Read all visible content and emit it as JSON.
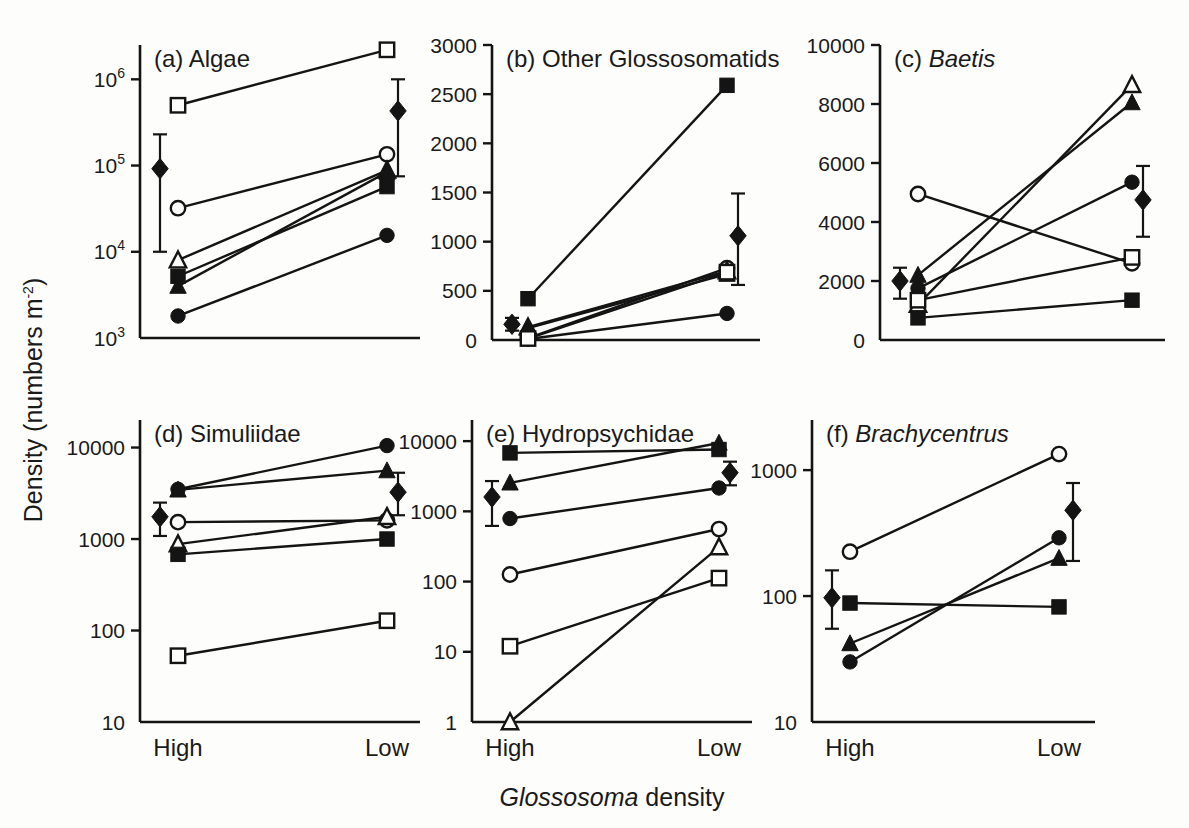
{
  "figure": {
    "y_axis_label_main": "Density (numbers m",
    "y_axis_label_sup": "-2",
    "y_axis_label_close": ")",
    "x_axis_label_italic": "Glossosoma",
    "x_axis_label_rest": " density",
    "categories": [
      "High",
      "Low"
    ],
    "line_color": "#141414",
    "background": "#fdfdfb"
  },
  "chart_data": [
    {
      "type": "line",
      "panel": "a",
      "title": "(a) Algae",
      "title_italic": "",
      "xlabel": "Glossosoma density",
      "ylabel": "Density (numbers m-2)",
      "yscale": "log",
      "ylim": [
        1000,
        2500000
      ],
      "ytick_values": [
        1000,
        10000,
        100000,
        1000000
      ],
      "ytick_labels": [
        "10^3",
        "10^4",
        "10^5",
        "10^6"
      ],
      "categories": [
        "High",
        "Low"
      ],
      "grid": false,
      "legend": "none",
      "series": [
        {
          "name": "open-square",
          "marker": "open-square",
          "values": [
            500000,
            2200000
          ]
        },
        {
          "name": "open-circle",
          "marker": "open-circle",
          "values": [
            32000,
            135000
          ]
        },
        {
          "name": "open-triangle",
          "marker": "open-triangle",
          "values": [
            8000,
            88000
          ]
        },
        {
          "name": "filled-square",
          "marker": "filled-square",
          "values": [
            5200,
            57000
          ]
        },
        {
          "name": "filled-triangle",
          "marker": "filled-triangle",
          "values": [
            4000,
            84000
          ]
        },
        {
          "name": "filled-circle",
          "marker": "filled-circle",
          "values": [
            1800,
            15500
          ]
        },
        {
          "name": "mean-diamond",
          "marker": "filled-diamond",
          "values": [
            92000,
            430000
          ],
          "error_high": [
            230000,
            1000000
          ],
          "error_low": [
            10000,
            75000
          ]
        }
      ]
    },
    {
      "type": "line",
      "panel": "b",
      "title": "(b) Other Glossosomatids",
      "title_italic": "",
      "xlabel": "Glossosoma density",
      "ylabel": "Density (numbers m-2)",
      "yscale": "linear",
      "ylim": [
        0,
        3000
      ],
      "ytick_values": [
        0,
        500,
        1000,
        1500,
        2000,
        2500,
        3000
      ],
      "ytick_labels": [
        "0",
        "500",
        "1000",
        "1500",
        "2000",
        "2500",
        "3000"
      ],
      "categories": [
        "High",
        "Low"
      ],
      "grid": false,
      "legend": "none",
      "series": [
        {
          "name": "filled-square",
          "marker": "filled-square",
          "values": [
            420,
            2590
          ]
        },
        {
          "name": "open-circle",
          "marker": "open-circle",
          "values": [
            20,
            730
          ]
        },
        {
          "name": "open-triangle",
          "marker": "open-triangle",
          "values": [
            130,
            700
          ]
        },
        {
          "name": "filled-triangle",
          "marker": "filled-triangle",
          "values": [
            120,
            670
          ]
        },
        {
          "name": "filled-circle",
          "marker": "filled-circle",
          "values": [
            10,
            270
          ]
        },
        {
          "name": "open-square",
          "marker": "open-square",
          "values": [
            15,
            690
          ]
        },
        {
          "name": "mean-diamond",
          "marker": "filled-diamond",
          "values": [
            160,
            1060
          ],
          "error_high": [
            225,
            1490
          ],
          "error_low": [
            95,
            560
          ]
        }
      ]
    },
    {
      "type": "line",
      "panel": "c",
      "title": "(c) Baetis",
      "title_italic": "Baetis",
      "xlabel": "Glossosoma density",
      "ylabel": "Density (numbers m-2)",
      "yscale": "linear",
      "ylim": [
        0,
        10000
      ],
      "ytick_values": [
        0,
        2000,
        4000,
        6000,
        8000,
        10000
      ],
      "ytick_labels": [
        "0",
        "2000",
        "4000",
        "6000",
        "8000",
        "10000"
      ],
      "categories": [
        "High",
        "Low"
      ],
      "grid": false,
      "legend": "none",
      "series": [
        {
          "name": "open-circle",
          "marker": "open-circle",
          "values": [
            4950,
            2600
          ]
        },
        {
          "name": "filled-triangle",
          "marker": "filled-triangle",
          "values": [
            2200,
            8050
          ]
        },
        {
          "name": "open-triangle",
          "marker": "open-triangle",
          "values": [
            1200,
            8650
          ]
        },
        {
          "name": "filled-circle",
          "marker": "filled-circle",
          "values": [
            1750,
            5350
          ]
        },
        {
          "name": "open-square",
          "marker": "open-square",
          "values": [
            1350,
            2800
          ]
        },
        {
          "name": "filled-square",
          "marker": "filled-square",
          "values": [
            750,
            1350
          ]
        },
        {
          "name": "mean-diamond",
          "marker": "filled-diamond",
          "values": [
            2000,
            4750
          ],
          "error_high": [
            2450,
            5900
          ],
          "error_low": [
            1400,
            3500
          ]
        }
      ]
    },
    {
      "type": "line",
      "panel": "d",
      "title": "(d) Simuliidae",
      "title_italic": "",
      "xlabel": "Glossosoma density",
      "ylabel": "Density (numbers m-2)",
      "yscale": "log",
      "ylim": [
        10,
        20000
      ],
      "ytick_values": [
        10,
        100,
        1000,
        10000
      ],
      "ytick_labels": [
        "10",
        "100",
        "1000",
        "10000"
      ],
      "categories": [
        "High",
        "Low"
      ],
      "grid": false,
      "legend": "none",
      "series": [
        {
          "name": "filled-circle",
          "marker": "filled-circle",
          "values": [
            3500,
            10500
          ]
        },
        {
          "name": "filled-triangle",
          "marker": "filled-triangle",
          "values": [
            3450,
            5600
          ]
        },
        {
          "name": "open-circle",
          "marker": "open-circle",
          "values": [
            1530,
            1600
          ]
        },
        {
          "name": "open-triangle",
          "marker": "open-triangle",
          "values": [
            880,
            1750
          ]
        },
        {
          "name": "filled-square",
          "marker": "filled-square",
          "values": [
            680,
            1000
          ]
        },
        {
          "name": "open-square",
          "marker": "open-square",
          "values": [
            53,
            128
          ]
        },
        {
          "name": "mean-diamond",
          "marker": "filled-diamond",
          "values": [
            1750,
            3250
          ],
          "error_high": [
            2500,
            5300
          ],
          "error_low": [
            1080,
            1820
          ]
        }
      ]
    },
    {
      "type": "line",
      "panel": "e",
      "title": "(e) Hydropsychidae",
      "title_italic": "",
      "xlabel": "Glossosoma density",
      "ylabel": "Density (numbers m-2)",
      "yscale": "log",
      "ylim": [
        1,
        20000
      ],
      "ytick_values": [
        1,
        10,
        100,
        1000,
        10000
      ],
      "ytick_labels": [
        "1",
        "10",
        "100",
        "1000",
        "10000"
      ],
      "categories": [
        "High",
        "Low"
      ],
      "grid": false,
      "legend": "none",
      "series": [
        {
          "name": "filled-square",
          "marker": "filled-square",
          "values": [
            6800,
            7600
          ]
        },
        {
          "name": "filled-triangle",
          "marker": "filled-triangle",
          "values": [
            2550,
            9400
          ]
        },
        {
          "name": "filled-circle",
          "marker": "filled-circle",
          "values": [
            790,
            2150
          ]
        },
        {
          "name": "open-circle",
          "marker": "open-circle",
          "values": [
            126,
            560
          ]
        },
        {
          "name": "open-triangle",
          "marker": "open-triangle",
          "values": [
            1,
            310
          ]
        },
        {
          "name": "open-square",
          "marker": "open-square",
          "values": [
            12,
            112
          ]
        },
        {
          "name": "mean-diamond",
          "marker": "filled-diamond",
          "values": [
            1600,
            3550
          ],
          "error_high": [
            2700,
            5100
          ],
          "error_low": [
            620,
            2350
          ]
        }
      ]
    },
    {
      "type": "line",
      "panel": "f",
      "title": "(f) Brachycentrus",
      "title_italic": "Brachycentrus",
      "xlabel": "Glossosoma density",
      "ylabel": "Density (numbers m-2)",
      "yscale": "log",
      "ylim": [
        10,
        2500
      ],
      "ytick_values": [
        10,
        100,
        1000
      ],
      "ytick_labels": [
        "10",
        "100",
        "1000"
      ],
      "categories": [
        "High",
        "Low"
      ],
      "grid": false,
      "legend": "none",
      "series": [
        {
          "name": "open-circle",
          "marker": "open-circle",
          "values": [
            225,
            1340
          ]
        },
        {
          "name": "filled-circle",
          "marker": "filled-circle",
          "values": [
            30,
            290
          ]
        },
        {
          "name": "filled-triangle",
          "marker": "filled-triangle",
          "values": [
            42,
            200
          ]
        },
        {
          "name": "filled-square",
          "marker": "filled-square",
          "values": [
            88,
            82
          ]
        },
        {
          "name": "mean-diamond",
          "marker": "filled-diamond",
          "values": [
            97,
            480
          ],
          "error_high": [
            160,
            790
          ],
          "error_low": [
            55,
            190
          ]
        }
      ]
    }
  ]
}
